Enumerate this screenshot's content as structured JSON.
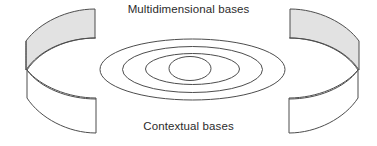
{
  "figure": {
    "title_top": "Multidimensional bases",
    "title_bottom": "Contextual bases",
    "background_color": "#ffffff",
    "stroke_color": "#4d4d4d",
    "shaded_fill": "#e2e2e2",
    "unshaded_fill": "#ffffff",
    "text_color": "#2b2b2b",
    "stroke_width": 1,
    "elements": {
      "left_band_shaded": "left-upper-ring-surface",
      "left_band_plain": "left-lower-ring-wall",
      "right_band_shaded": "right-upper-ring-surface",
      "right_band_plain": "right-lower-ring-wall",
      "center_rings_count": 4
    },
    "center_rings": [
      {
        "name": "ring-outer",
        "cx": 192.5,
        "cy": 69.5,
        "rx": 92.5,
        "ry": 30.5
      },
      {
        "name": "ring-second",
        "cx": 192.5,
        "cy": 69.5,
        "rx": 70.0,
        "ry": 23.0
      },
      {
        "name": "ring-third",
        "cx": 192.5,
        "cy": 69.0,
        "rx": 47.0,
        "ry": 15.5
      },
      {
        "name": "ring-inner",
        "cx": 190.0,
        "cy": 68.5,
        "rx": 21.0,
        "ry": 12.0
      }
    ]
  }
}
